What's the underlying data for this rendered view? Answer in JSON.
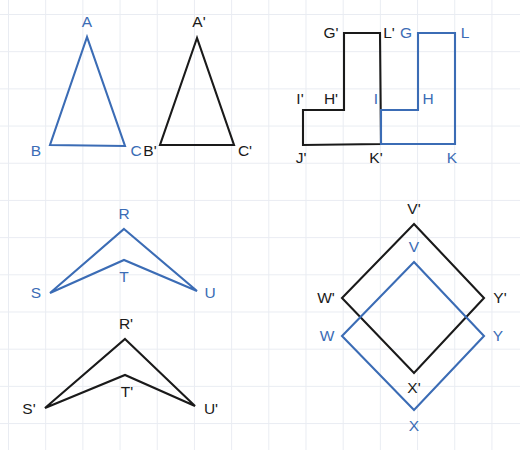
{
  "page": {
    "width": 520,
    "height": 450,
    "background_color": "#ffffff",
    "grid": {
      "visible": true,
      "color": "#e9ecf2",
      "spacing_px": 37.2
    }
  },
  "colors": {
    "preimage_blue": "#3b6cb5",
    "image_black": "#1a1a1a",
    "grid": "#e9ecf2",
    "background": "#ffffff"
  },
  "figures": [
    {
      "id": "triangle-abc",
      "name": "triangle-ABC",
      "shape": "triangle",
      "color_role": "preimage_blue",
      "color": "#3b6cb5",
      "closed": true,
      "points": "87,37 50,145 125,146",
      "vertices": [
        {
          "label": "A",
          "x": 87,
          "y": 37,
          "lx": 87,
          "ly": 22,
          "color": "#3b6cb5"
        },
        {
          "label": "B",
          "x": 50,
          "y": 145,
          "lx": 36,
          "ly": 151,
          "color": "#3b6cb5"
        },
        {
          "label": "C",
          "x": 125,
          "y": 146,
          "lx": 136,
          "ly": 151,
          "color": "#3b6cb5"
        }
      ]
    },
    {
      "id": "triangle-abc-prime",
      "name": "triangle-A-prime-B-prime-C-prime",
      "shape": "triangle",
      "color_role": "image_black",
      "color": "#1a1a1a",
      "closed": true,
      "points": "197,38 160,145 234,145",
      "vertices": [
        {
          "label": "A'",
          "x": 197,
          "y": 38,
          "lx": 199,
          "ly": 22,
          "color": "#1a1a1a"
        },
        {
          "label": "B'",
          "x": 160,
          "y": 145,
          "lx": 150,
          "ly": 151,
          "color": "#1a1a1a"
        },
        {
          "label": "C'",
          "x": 234,
          "y": 145,
          "lx": 245,
          "ly": 151,
          "color": "#1a1a1a"
        }
      ]
    },
    {
      "id": "step-ghijkl-prime",
      "name": "step-polygon-G-prime-through-L-prime",
      "shape": "step-polygon",
      "color_role": "image_black",
      "color": "#1a1a1a",
      "closed": true,
      "points": "344,33 380,33 381,144 303,145 303,110 344,110",
      "vertices": [
        {
          "label": "G'",
          "x": 344,
          "y": 33,
          "lx": 331,
          "ly": 33,
          "color": "#1a1a1a"
        },
        {
          "label": "L'",
          "x": 380,
          "y": 33,
          "lx": 389,
          "ly": 33,
          "color": "#1a1a1a"
        },
        {
          "label": "K'",
          "x": 381,
          "y": 144,
          "lx": 376,
          "ly": 158,
          "color": "#1a1a1a"
        },
        {
          "label": "J'",
          "x": 303,
          "y": 145,
          "lx": 301,
          "ly": 158,
          "color": "#1a1a1a"
        },
        {
          "label": "I'",
          "x": 303,
          "y": 110,
          "lx": 300,
          "ly": 99,
          "color": "#1a1a1a"
        },
        {
          "label": "H'",
          "x": 344,
          "y": 110,
          "lx": 331,
          "ly": 99,
          "color": "#1a1a1a"
        }
      ]
    },
    {
      "id": "step-ghijkl",
      "name": "step-polygon-G-through-L",
      "shape": "step-polygon",
      "color_role": "preimage_blue",
      "color": "#3b6cb5",
      "closed": true,
      "points": "418,33 455,33 455,144 381,144 381,110 418,110",
      "vertices": [
        {
          "label": "G",
          "x": 418,
          "y": 33,
          "lx": 406,
          "ly": 33,
          "color": "#3b6cb5"
        },
        {
          "label": "L",
          "x": 455,
          "y": 33,
          "lx": 465,
          "ly": 33,
          "color": "#3b6cb5"
        },
        {
          "label": "K",
          "x": 455,
          "y": 144,
          "lx": 452,
          "ly": 158,
          "color": "#3b6cb5"
        },
        {
          "label": "I",
          "x": 381,
          "y": 110,
          "lx": 376,
          "ly": 99,
          "color": "#3b6cb5"
        },
        {
          "label": "H",
          "x": 418,
          "y": 110,
          "lx": 428,
          "ly": 99,
          "color": "#3b6cb5"
        }
      ]
    },
    {
      "id": "chevron-rstu",
      "name": "chevron-RSTU",
      "shape": "chevron-quadrilateral",
      "color_role": "preimage_blue",
      "color": "#3b6cb5",
      "closed": true,
      "points": "124,229 197,291 124,260 50,293",
      "vertices": [
        {
          "label": "R",
          "x": 124,
          "y": 229,
          "lx": 124,
          "ly": 214,
          "color": "#3b6cb5"
        },
        {
          "label": "S",
          "x": 50,
          "y": 293,
          "lx": 36,
          "ly": 293,
          "color": "#3b6cb5"
        },
        {
          "label": "T",
          "x": 124,
          "y": 260,
          "lx": 124,
          "ly": 277,
          "color": "#3b6cb5"
        },
        {
          "label": "U",
          "x": 197,
          "y": 291,
          "lx": 210,
          "ly": 293,
          "color": "#3b6cb5"
        }
      ]
    },
    {
      "id": "chevron-rstu-prime",
      "name": "chevron-R-prime-S-prime-T-prime-U-prime",
      "shape": "chevron-quadrilateral",
      "color_role": "image_black",
      "color": "#1a1a1a",
      "closed": true,
      "points": "125,339 195,406 125,375 45,408",
      "vertices": [
        {
          "label": "R'",
          "x": 125,
          "y": 339,
          "lx": 126,
          "ly": 324,
          "color": "#1a1a1a"
        },
        {
          "label": "S'",
          "x": 45,
          "y": 408,
          "lx": 29,
          "ly": 409,
          "color": "#1a1a1a"
        },
        {
          "label": "T'",
          "x": 125,
          "y": 375,
          "lx": 127,
          "ly": 392,
          "color": "#1a1a1a"
        },
        {
          "label": "U'",
          "x": 195,
          "y": 406,
          "lx": 211,
          "ly": 409,
          "color": "#1a1a1a"
        }
      ]
    },
    {
      "id": "diamond-vwxy-prime",
      "name": "diamond-V-prime-W-prime-X-prime-Y-prime",
      "shape": "rhombus",
      "color_role": "image_black",
      "color": "#1a1a1a",
      "closed": true,
      "points": "414,224 484,298 414,373 342,298",
      "vertices": [
        {
          "label": "V'",
          "x": 414,
          "y": 224,
          "lx": 414,
          "ly": 209,
          "color": "#1a1a1a"
        },
        {
          "label": "W'",
          "x": 342,
          "y": 298,
          "lx": 326,
          "ly": 298,
          "color": "#1a1a1a"
        },
        {
          "label": "X'",
          "x": 414,
          "y": 373,
          "lx": 414,
          "ly": 388,
          "color": "#1a1a1a"
        },
        {
          "label": "Y'",
          "x": 484,
          "y": 298,
          "lx": 500,
          "ly": 298,
          "color": "#1a1a1a"
        }
      ]
    },
    {
      "id": "diamond-vwxy",
      "name": "diamond-VWXY",
      "shape": "rhombus",
      "color_role": "preimage_blue",
      "color": "#3b6cb5",
      "closed": true,
      "points": "414,262 484,336 414,410 342,336",
      "vertices": [
        {
          "label": "V",
          "x": 414,
          "y": 262,
          "lx": 414,
          "ly": 247,
          "color": "#3b6cb5"
        },
        {
          "label": "W",
          "x": 342,
          "y": 336,
          "lx": 327,
          "ly": 336,
          "color": "#3b6cb5"
        },
        {
          "label": "X",
          "x": 414,
          "y": 410,
          "lx": 414,
          "ly": 426,
          "color": "#3b6cb5"
        },
        {
          "label": "Y",
          "x": 484,
          "y": 336,
          "lx": 498,
          "ly": 336,
          "color": "#3b6cb5"
        }
      ]
    }
  ]
}
